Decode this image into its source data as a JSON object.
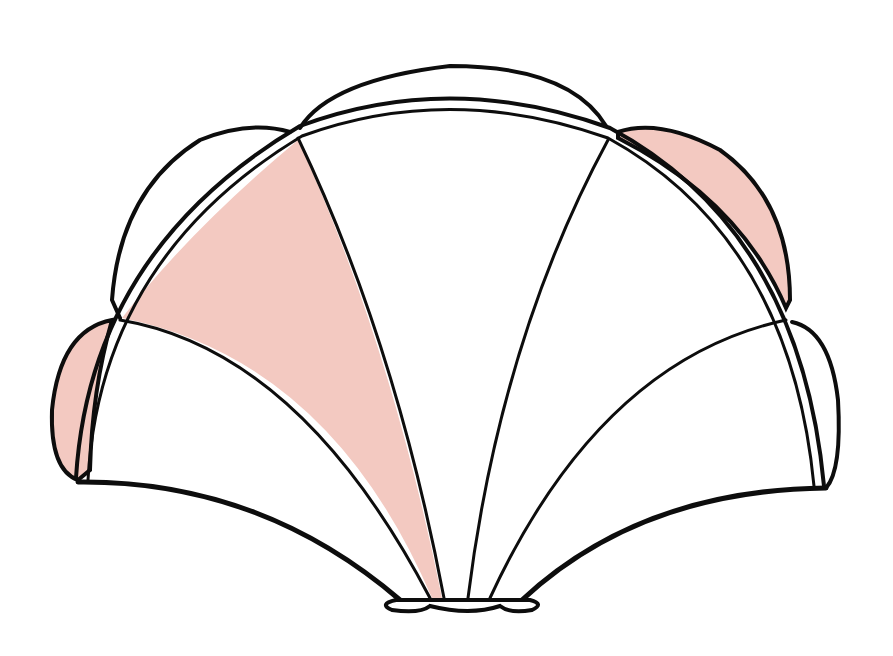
{
  "diagram": {
    "colors": {
      "background": "#ffffff",
      "outline": "#0d0d0d",
      "shaded": "#f3c9c1"
    },
    "panels": [
      {
        "id": "left-outer",
        "shaded": false
      },
      {
        "id": "left-inner",
        "shaded": true
      },
      {
        "id": "center",
        "shaded": false
      },
      {
        "id": "right-inner",
        "shaded": false
      },
      {
        "id": "right-outer",
        "shaded": false
      }
    ],
    "lobes": [
      {
        "id": "far-left",
        "shaded": true
      },
      {
        "id": "upper-left",
        "shaded": false
      },
      {
        "id": "top",
        "shaded": false
      },
      {
        "id": "upper-right",
        "shaded": true
      },
      {
        "id": "far-right",
        "shaded": false
      }
    ]
  }
}
